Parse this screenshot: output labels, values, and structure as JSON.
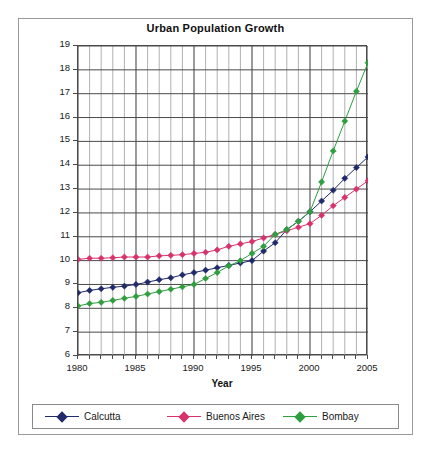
{
  "chart_data": {
    "type": "line",
    "title": "Urban Population Growth",
    "xlabel": "Year",
    "ylabel": "Population in Millions",
    "xlim": [
      1980,
      2005
    ],
    "ylim": [
      6,
      19
    ],
    "ytick_labels": [
      "19",
      "18",
      "17",
      "16",
      "15",
      "14",
      "13",
      "12",
      "11",
      "10",
      "9",
      "8",
      "7",
      "6"
    ],
    "yticks": [
      19,
      18,
      17,
      16,
      15,
      14,
      13,
      12,
      11,
      10,
      9,
      8,
      7,
      6
    ],
    "xtick_labels": [
      "1980",
      "1985",
      "1990",
      "1995",
      "2000",
      "2005"
    ],
    "xticks": [
      1980,
      1985,
      1990,
      1995,
      2000,
      2005
    ],
    "grid": "both",
    "legend_position": "bottom",
    "marker": "diamond",
    "x": [
      1980,
      1981,
      1982,
      1983,
      1984,
      1985,
      1986,
      1987,
      1988,
      1989,
      1990,
      1991,
      1992,
      1993,
      1994,
      1995,
      1996,
      1997,
      1998,
      1999,
      2000,
      2001,
      2002,
      2003,
      2004,
      2005
    ],
    "series": [
      {
        "name": "Calcutta",
        "color": "#1f2a6b",
        "values": [
          8.65,
          8.75,
          8.82,
          8.88,
          8.93,
          9.0,
          9.1,
          9.2,
          9.28,
          9.4,
          9.5,
          9.6,
          9.7,
          9.8,
          9.9,
          10.0,
          10.4,
          10.75,
          11.3,
          11.65,
          12.05,
          12.5,
          12.95,
          13.45,
          13.9,
          14.35
        ]
      },
      {
        "name": "Buenos Aires",
        "color": "#d6336c",
        "values": [
          10.05,
          10.1,
          10.1,
          10.12,
          10.15,
          10.15,
          10.15,
          10.2,
          10.22,
          10.25,
          10.3,
          10.35,
          10.45,
          10.6,
          10.7,
          10.8,
          10.95,
          11.1,
          11.25,
          11.4,
          11.55,
          11.9,
          12.3,
          12.65,
          13.0,
          13.35
        ]
      },
      {
        "name": "Bombay",
        "color": "#2e9e3e",
        "values": [
          8.1,
          8.2,
          8.25,
          8.33,
          8.42,
          8.5,
          8.6,
          8.7,
          8.8,
          8.9,
          9.0,
          9.25,
          9.5,
          9.78,
          10.0,
          10.3,
          10.6,
          11.1,
          11.3,
          11.65,
          12.05,
          13.3,
          14.6,
          15.85,
          17.1,
          18.3
        ]
      }
    ]
  },
  "legend": {
    "items": [
      {
        "label": "Calcutta",
        "color": "#1f2a6b"
      },
      {
        "label": "Buenos Aires",
        "color": "#d6336c"
      },
      {
        "label": "Bombay",
        "color": "#2e9e3e"
      }
    ]
  }
}
